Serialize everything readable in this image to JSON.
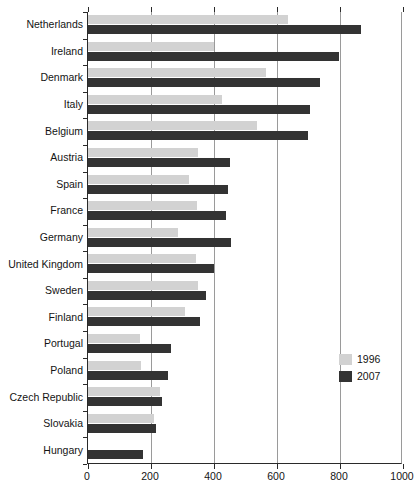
{
  "chart_data": {
    "type": "bar",
    "orientation": "horizontal",
    "title": "",
    "xlabel": "",
    "ylabel": "",
    "xlim": [
      0,
      1000
    ],
    "xticks": [
      0,
      200,
      400,
      600,
      800,
      1000
    ],
    "xtick_labels": [
      "0",
      "200",
      "400",
      "600",
      "800",
      "1000"
    ],
    "grid": true,
    "legend_position": "right-inside",
    "categories": [
      "Netherlands",
      "Ireland",
      "Denmark",
      "Italy",
      "Belgium",
      "Austria",
      "Spain",
      "France",
      "Germany",
      "United Kingdom",
      "Sweden",
      "Finland",
      "Portugal",
      "Poland",
      "Czech Republic",
      "Slovakia",
      "Hungary"
    ],
    "series": [
      {
        "name": "1996",
        "color": "#d2d2d2",
        "values": [
          635,
          400,
          566,
          426,
          536,
          350,
          322,
          346,
          287,
          343,
          350,
          309,
          166,
          169,
          229,
          209,
          null
        ]
      },
      {
        "name": "2007",
        "color": "#333333",
        "values": [
          868,
          798,
          735,
          705,
          698,
          451,
          444,
          439,
          453,
          400,
          375,
          354,
          262,
          253,
          234,
          216,
          174
        ]
      }
    ]
  },
  "legend": {
    "items": [
      {
        "label": "1996",
        "swatch": "light-gray"
      },
      {
        "label": "2007",
        "swatch": "dark-gray"
      }
    ]
  },
  "top_fragment": {
    "text": ""
  }
}
